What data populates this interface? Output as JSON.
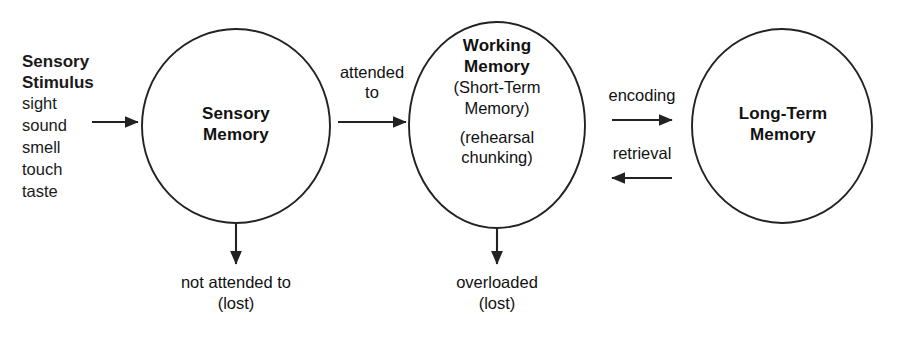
{
  "diagram": {
    "stroke_color": "#222222",
    "text_color": "#111111",
    "background_color": "#ffffff"
  },
  "stimulus": {
    "heading_line1": "Sensory",
    "heading_line2": "Stimulus",
    "items": [
      "sight",
      "sound",
      "smell",
      "touch",
      "taste"
    ]
  },
  "nodes": [
    {
      "id": "sensory-memory",
      "title_line1": "Sensory",
      "title_line2": "Memory",
      "sublines": []
    },
    {
      "id": "working-memory",
      "title_line1": "Working",
      "title_line2": "Memory",
      "sublines": [
        "(Short-Term",
        "Memory)",
        "(rehearsal",
        "chunking)"
      ]
    },
    {
      "id": "long-term-memory",
      "title_line1": "Long-Term",
      "title_line2": "Memory",
      "sublines": []
    }
  ],
  "edges": {
    "stimulus_to_sensory": "",
    "attended_line1": "attended",
    "attended_line2": "to",
    "encoding": "encoding",
    "retrieval": "retrieval"
  },
  "losses": [
    {
      "id": "sensory-loss",
      "line1": "not attended to",
      "line2": "(lost)"
    },
    {
      "id": "working-loss",
      "line1": "overloaded",
      "line2": "(lost)"
    }
  ]
}
